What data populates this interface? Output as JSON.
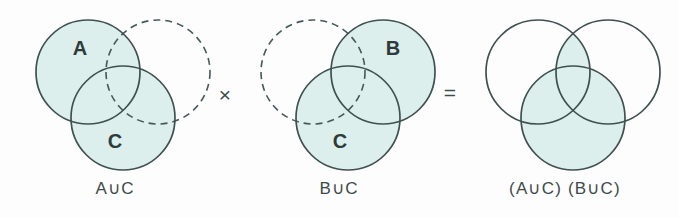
{
  "figure": {
    "background_color": "#fdfdfd",
    "fill_color": "#ddefec",
    "stroke_color": "#3f5050",
    "text_color": "#3f4a4a"
  },
  "panels": [
    {
      "id": "panel-a-union-c",
      "caption": "A∪C",
      "circles": [
        {
          "name": "A",
          "label": "A",
          "style": "solid",
          "filled": true,
          "cx": 88,
          "cy": 72,
          "r": 52,
          "label_x": 80,
          "label_y": 55
        },
        {
          "name": "B",
          "label": "",
          "style": "dashed",
          "filled": false,
          "cx": 158,
          "cy": 72,
          "r": 52,
          "label_x": 168,
          "label_y": 55
        },
        {
          "name": "C",
          "label": "C",
          "style": "solid",
          "filled": true,
          "cx": 123,
          "cy": 118,
          "r": 52,
          "label_x": 115,
          "label_y": 145
        }
      ]
    },
    {
      "id": "panel-b-union-c",
      "caption": "B∪C",
      "circles": [
        {
          "name": "A",
          "label": "",
          "style": "dashed",
          "filled": false,
          "cx": 313,
          "cy": 72,
          "r": 52,
          "label_x": 305,
          "label_y": 55
        },
        {
          "name": "B",
          "label": "B",
          "style": "solid",
          "filled": true,
          "cx": 383,
          "cy": 72,
          "r": 52,
          "label_x": 393,
          "label_y": 55
        },
        {
          "name": "C",
          "label": "C",
          "style": "solid",
          "filled": true,
          "cx": 348,
          "cy": 118,
          "r": 52,
          "label_x": 340,
          "label_y": 145
        }
      ]
    },
    {
      "id": "panel-result",
      "caption": "(A∪C) (B∪C)",
      "circles": [
        {
          "name": "A",
          "label": "",
          "style": "solid",
          "filled": false,
          "cx": 538,
          "cy": 72,
          "r": 52,
          "label_x": 530,
          "label_y": 55
        },
        {
          "name": "B",
          "label": "",
          "style": "solid",
          "filled": false,
          "cx": 608,
          "cy": 72,
          "r": 52,
          "label_x": 618,
          "label_y": 55
        },
        {
          "name": "C",
          "label": "",
          "style": "solid",
          "filled": false,
          "cx": 573,
          "cy": 118,
          "r": 52,
          "label_x": 565,
          "label_y": 145
        }
      ]
    }
  ],
  "operators": [
    {
      "id": "multiply",
      "symbol": "×",
      "x": 222,
      "y": 85
    },
    {
      "id": "equals",
      "symbol": "=",
      "x": 444,
      "y": 83
    }
  ]
}
